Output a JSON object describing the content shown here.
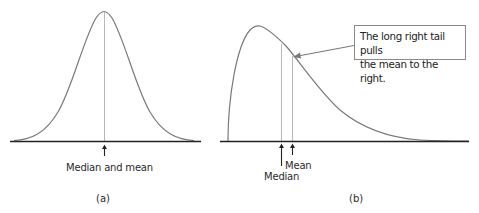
{
  "panels": [
    {
      "id": "a",
      "label": "(a)",
      "shape": "symmetric bell curve",
      "annotation": "Median and mean"
    },
    {
      "id": "b",
      "label": "(b)",
      "shape": "right-skewed curve",
      "annotations": {
        "median": "Median",
        "mean": "Mean"
      },
      "callout": {
        "line1": "The long right tail pulls",
        "line2": "the mean to the right."
      }
    }
  ],
  "colors": {
    "curve": "#7a7a7a",
    "axis": "#222222",
    "guide_line": "#b8b8b8",
    "text": "#2a2a2a"
  }
}
